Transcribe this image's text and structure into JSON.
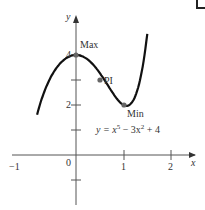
{
  "chart_data": {
    "type": "line",
    "title": "",
    "equation": "y = x^5 − 3x^2 + 4",
    "xlabel": "x",
    "ylabel": "y",
    "xlim": [
      -1.3,
      2.3
    ],
    "ylim": [
      -1.8,
      5.0
    ],
    "x_ticks": [
      "−1",
      "0",
      "1",
      "2"
    ],
    "y_ticks": [
      "2",
      "4"
    ],
    "grid": false,
    "series": [
      {
        "name": "y = x^5 − 3x^2 + 4",
        "function": "x^5 - 3x^2 + 4",
        "x_range": [
          -0.82,
          1.5
        ]
      }
    ],
    "annotations": [
      {
        "label": "Max",
        "x": 0,
        "y": 4
      },
      {
        "label": "PI",
        "x": 0.5,
        "y": 3
      },
      {
        "label": "Min",
        "x": 1.06,
        "y": 1.97
      }
    ]
  },
  "labels": {
    "x_axis": "x",
    "y_axis": "y",
    "tick_neg1": "−1",
    "tick_0": "0",
    "tick_1": "1",
    "tick_2": "2",
    "ytick_2": "2",
    "ytick_4": "4",
    "max": "Max",
    "pi": "PI",
    "min": "Min",
    "equation_prefix": "y = x",
    "equation_exp1": "5",
    "equation_mid": " − 3x",
    "equation_exp2": "2",
    "equation_suffix": " + 4"
  }
}
